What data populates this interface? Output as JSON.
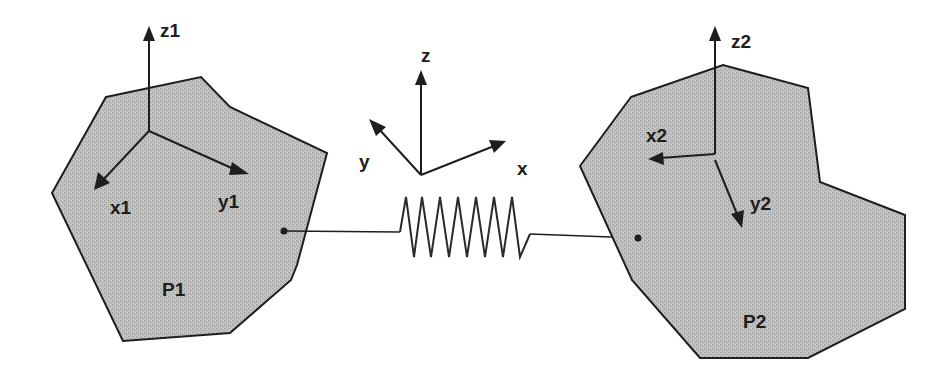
{
  "figure": {
    "colors": {
      "background": "#ffffff",
      "body_fill": "#b9b9b9",
      "stroke": "#1e1e1e"
    },
    "global_frame": {
      "labels": {
        "z": "z",
        "y": "y",
        "x": "x"
      }
    },
    "body1": {
      "label": "P1",
      "frame": {
        "z": "z1",
        "x": "x1",
        "y": "y1"
      }
    },
    "body2": {
      "label": "P2",
      "frame": {
        "z": "z2",
        "x": "x2",
        "y": "y2"
      }
    },
    "connector": {
      "type": "spring",
      "coils": 7
    }
  }
}
